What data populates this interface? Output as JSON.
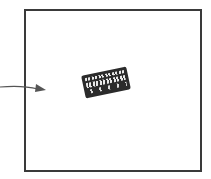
{
  "figure": {
    "frame": {
      "border_color": "#3a3a3a",
      "background": "#ffffff"
    },
    "arrow": {
      "color": "#555555",
      "direction": "right",
      "points_to": "label-object"
    },
    "object": {
      "description": "small tilted printed label / ticket with illegible text",
      "color": "#2b2b2b",
      "rotation_deg": -12
    }
  }
}
